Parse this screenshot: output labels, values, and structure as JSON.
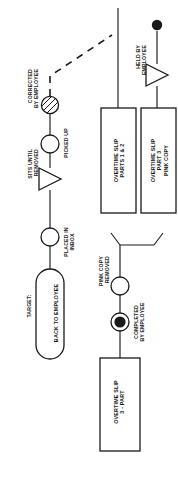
{
  "diagram": {
    "orientation": "rotated-90-ccw",
    "background_color": "#ffffff",
    "line_color": "#1a1a1a",
    "nodes": [
      {
        "id": "start-document",
        "type": "document-rectangle",
        "label": "OVERTIME SLIP\n3 - PART"
      },
      {
        "id": "completed-by-employee",
        "type": "operation-circle-filled",
        "label": "COMPLETED\nBY EMPLOYEE"
      },
      {
        "id": "pink-copy-removed",
        "type": "operation-circle",
        "label": "PINK COPY\nREMOVED"
      },
      {
        "id": "overtime-slip-parts-1-2",
        "type": "document-rectangle",
        "label": "OVERTIME SLIP\nPARTS 1 & 2"
      },
      {
        "id": "overtime-slip-part-3",
        "type": "document-rectangle",
        "label": "OVERTIME SLIP\nPART 3\nPINK COPY"
      },
      {
        "id": "held-by-employee",
        "type": "delay-triangle",
        "label": "HELD BY\nEMPLOYEE"
      },
      {
        "id": "end-terminator-dot",
        "type": "filled-dot-terminator",
        "label": ""
      },
      {
        "id": "corrected-by-employee",
        "type": "inspection-circle-hatched",
        "label": "CORRECTED\nBY EMPLOYEE"
      },
      {
        "id": "picked-up",
        "type": "operation-circle",
        "label": "PICKED UP"
      },
      {
        "id": "sits-until-removed",
        "type": "delay-triangle",
        "label": "SITS UNTIL\nREMOVED"
      },
      {
        "id": "placed-in-inbox",
        "type": "operation-circle",
        "label": "PLACED IN\nINBOX"
      },
      {
        "id": "back-to-employee",
        "type": "terminator-rounded-rectangle",
        "label": "BACK TO EMPLOYEE",
        "caption": "TARGET:"
      }
    ],
    "labels": {
      "start_document": "OVERTIME SLIP\n3 - PART",
      "completed_by_employee": "COMPLETED\nBY EMPLOYEE",
      "pink_copy_removed": "PINK COPY\nREMOVED",
      "slip_parts_1_2": "OVERTIME SLIP\nPARTS 1 & 2",
      "slip_part_3": "OVERTIME SLIP\nPART 3\nPINK COPY",
      "held_by_employee": "HELD BY\nEMPLOYEE",
      "corrected_by_employee": "CORRECTED\nBY EMPLOYEE",
      "picked_up": "PICKED UP",
      "sits_until_removed": "SITS UNTIL\nREMOVED",
      "placed_in_inbox": "PLACED IN\nINBOX",
      "target_caption": "TARGET:",
      "back_to_employee": "BACK TO EMPLOYEE"
    },
    "connectors": [
      {
        "id": "branch-split",
        "type": "solid-branch"
      },
      {
        "id": "dashed-return",
        "type": "dashed-line"
      }
    ]
  }
}
